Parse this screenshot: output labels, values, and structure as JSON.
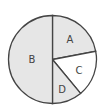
{
  "chart_data": {
    "type": "pie",
    "title": "",
    "categories": [
      "A",
      "C",
      "D",
      "B"
    ],
    "values": [
      22,
      17,
      11,
      50
    ],
    "unit": "percent (estimated from angles)",
    "start_angle_deg": 90,
    "direction": "clockwise",
    "colors": {
      "A": "#e6e6e6",
      "B": "#e6e6e6",
      "C": "#ffffff",
      "D": "#e6e6e6"
    },
    "labels_shown": true,
    "legend": "none"
  },
  "labels": {
    "a": "A",
    "b": "B",
    "c": "C",
    "d": "D"
  },
  "style": {
    "stroke": "#444444",
    "fill_gray": "#e6e6e6",
    "fill_white": "#ffffff"
  }
}
